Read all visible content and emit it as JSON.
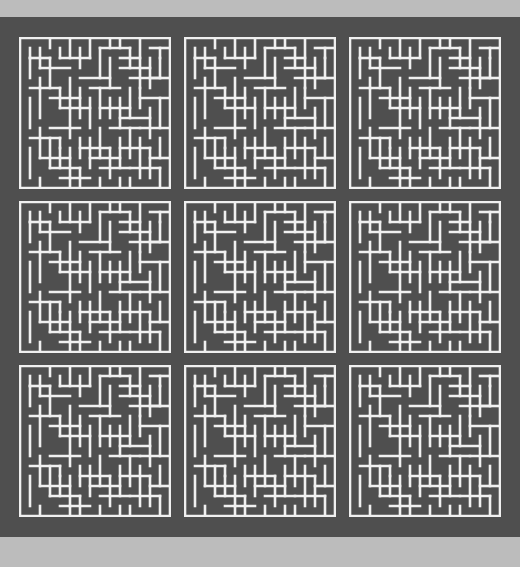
{
  "figure": {
    "background_color": "#b9b9b9",
    "panel_color": "#4f4f4f",
    "wall_color": "#f0f0f0",
    "panel": {
      "x": 0,
      "y": 17,
      "width": 520,
      "height": 520
    },
    "grid": {
      "rows": 3,
      "columns": 3,
      "tile_count": 9,
      "tile_size_px": 152,
      "gap_px": 20
    },
    "maze": {
      "cells_x": 15,
      "cells_y": 15,
      "wall_thickness_px": 2,
      "type": "perfect-maze"
    }
  },
  "chart_data": {
    "type": "heatmap",
    "title": "",
    "xlabel": "",
    "ylabel": "",
    "categories": [
      "tile-r1c1",
      "tile-r1c2",
      "tile-r1c3",
      "tile-r2c1",
      "tile-r2c2",
      "tile-r2c3",
      "tile-r3c1",
      "tile-r3c2",
      "tile-r3c3"
    ],
    "values": [
      1,
      1,
      1,
      1,
      1,
      1,
      1,
      1,
      1
    ],
    "legend_position": "none",
    "grid": false,
    "note": "All nine panels render the same 15x15 maze layout",
    "maze_cells": 15,
    "maze_walls_h": [
      "111111111111111",
      "010001000100010",
      "001010010001001",
      "010100100100100",
      "001001001010010",
      "100100010001001",
      "010010100100100",
      "001001001001010",
      "100100100010001",
      "010001010100100",
      "001010001001010",
      "100100100100001",
      "010001001010100",
      "001010100001001",
      "100100010100010",
      "111111111111111"
    ],
    "maze_walls_v": [
      "1001001000100101",
      "1010010010010011",
      "1001001001001001",
      "1000100100100101",
      "1010010010001011",
      "1001001001010001",
      "1100100100100101",
      "1010010010010011",
      "1001001001001001",
      "1000100100100101",
      "1010010010010011",
      "1001001001001001",
      "1010010001001011",
      "1001000100100101",
      "1000101001010011"
    ]
  },
  "tiles": [
    {
      "name": "tile-r1c1",
      "row": 1,
      "col": 1
    },
    {
      "name": "tile-r1c2",
      "row": 1,
      "col": 2
    },
    {
      "name": "tile-r1c3",
      "row": 1,
      "col": 3
    },
    {
      "name": "tile-r2c1",
      "row": 2,
      "col": 1
    },
    {
      "name": "tile-r2c2",
      "row": 2,
      "col": 2
    },
    {
      "name": "tile-r2c3",
      "row": 2,
      "col": 3
    },
    {
      "name": "tile-r3c1",
      "row": 3,
      "col": 1
    },
    {
      "name": "tile-r3c2",
      "row": 3,
      "col": 2
    },
    {
      "name": "tile-r3c3",
      "row": 3,
      "col": 3
    }
  ],
  "maze_segments": [
    [
      0,
      0,
      150,
      0
    ],
    [
      0,
      0,
      0,
      150
    ],
    [
      150,
      0,
      150,
      150
    ],
    [
      0,
      150,
      150,
      150
    ],
    [
      10,
      10,
      10,
      40
    ],
    [
      10,
      20,
      30,
      20
    ],
    [
      20,
      10,
      20,
      30
    ],
    [
      30,
      20,
      30,
      50
    ],
    [
      20,
      30,
      50,
      30
    ],
    [
      40,
      10,
      40,
      20
    ],
    [
      40,
      20,
      70,
      20
    ],
    [
      60,
      10,
      60,
      30
    ],
    [
      70,
      0,
      70,
      20
    ],
    [
      80,
      10,
      110,
      10
    ],
    [
      80,
      10,
      80,
      40
    ],
    [
      90,
      20,
      90,
      50
    ],
    [
      100,
      20,
      120,
      20
    ],
    [
      110,
      10,
      110,
      30
    ],
    [
      120,
      0,
      120,
      50
    ],
    [
      130,
      10,
      150,
      10
    ],
    [
      130,
      20,
      130,
      50
    ],
    [
      140,
      20,
      140,
      40
    ],
    [
      130,
      40,
      150,
      40
    ],
    [
      10,
      50,
      40,
      50
    ],
    [
      10,
      60,
      10,
      90
    ],
    [
      20,
      50,
      20,
      80
    ],
    [
      30,
      60,
      60,
      60
    ],
    [
      40,
      50,
      40,
      70
    ],
    [
      50,
      40,
      50,
      70
    ],
    [
      40,
      70,
      70,
      70
    ],
    [
      50,
      70,
      50,
      100
    ],
    [
      60,
      40,
      90,
      40
    ],
    [
      60,
      50,
      60,
      80
    ],
    [
      70,
      50,
      100,
      50
    ],
    [
      80,
      50,
      80,
      80
    ],
    [
      70,
      60,
      70,
      90
    ],
    [
      80,
      70,
      110,
      70
    ],
    [
      90,
      60,
      90,
      80
    ],
    [
      100,
      60,
      100,
      90
    ],
    [
      110,
      50,
      110,
      80
    ],
    [
      100,
      80,
      130,
      80
    ],
    [
      120,
      50,
      120,
      70
    ],
    [
      120,
      60,
      150,
      60
    ],
    [
      130,
      70,
      130,
      100
    ],
    [
      140,
      60,
      140,
      90
    ],
    [
      120,
      90,
      150,
      90
    ],
    [
      10,
      100,
      40,
      100
    ],
    [
      20,
      90,
      20,
      120
    ],
    [
      10,
      110,
      10,
      140
    ],
    [
      30,
      100,
      30,
      130
    ],
    [
      20,
      120,
      50,
      120
    ],
    [
      40,
      100,
      40,
      130
    ],
    [
      30,
      130,
      60,
      130
    ],
    [
      50,
      110,
      50,
      140
    ],
    [
      40,
      140,
      70,
      140
    ],
    [
      60,
      100,
      60,
      120
    ],
    [
      60,
      110,
      90,
      110
    ],
    [
      70,
      100,
      70,
      130
    ],
    [
      80,
      90,
      80,
      120
    ],
    [
      70,
      120,
      100,
      120
    ],
    [
      90,
      110,
      90,
      140
    ],
    [
      80,
      130,
      110,
      130
    ],
    [
      100,
      100,
      100,
      130
    ],
    [
      110,
      90,
      110,
      120
    ],
    [
      100,
      110,
      130,
      110
    ],
    [
      120,
      100,
      120,
      140
    ],
    [
      110,
      130,
      140,
      130
    ],
    [
      130,
      110,
      130,
      140
    ],
    [
      140,
      100,
      140,
      120
    ],
    [
      130,
      120,
      150,
      120
    ],
    [
      140,
      130,
      140,
      150
    ],
    [
      10,
      20,
      10,
      20
    ],
    [
      100,
      30,
      130,
      30
    ],
    [
      90,
      0,
      90,
      10
    ],
    [
      30,
      0,
      30,
      10
    ],
    [
      50,
      0,
      50,
      20
    ],
    [
      100,
      0,
      100,
      10
    ],
    [
      140,
      10,
      140,
      20
    ],
    [
      20,
      140,
      20,
      150
    ],
    [
      50,
      140,
      50,
      150
    ],
    [
      80,
      140,
      80,
      150
    ],
    [
      110,
      140,
      110,
      150
    ],
    [
      30,
      90,
      60,
      90
    ],
    [
      110,
      40,
      140,
      40
    ],
    [
      20,
      40,
      20,
      50
    ],
    [
      60,
      130,
      60,
      150
    ],
    [
      90,
      90,
      120,
      90
    ],
    [
      40,
      110,
      40,
      110
    ],
    [
      100,
      140,
      100,
      150
    ]
  ]
}
